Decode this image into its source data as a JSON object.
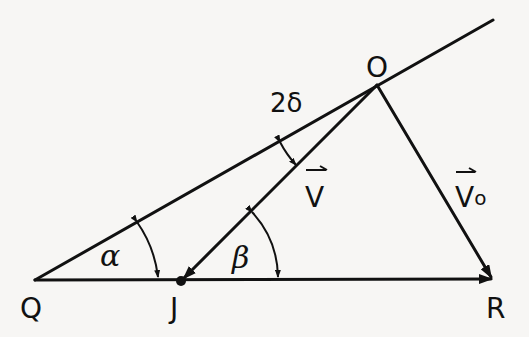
{
  "diagram": {
    "type": "vector-geometry",
    "points": [
      {
        "id": "Q",
        "label": "Q",
        "x": 35,
        "y": 280
      },
      {
        "id": "J",
        "label": "J",
        "x": 181,
        "y": 281
      },
      {
        "id": "R",
        "label": "R",
        "x": 493,
        "y": 279
      },
      {
        "id": "O",
        "label": "O",
        "x": 377,
        "y": 85
      }
    ],
    "vectors": [
      {
        "id": "V",
        "label": "V",
        "from": "O",
        "to": "J"
      },
      {
        "id": "Vo",
        "label": "Vo",
        "from": "O",
        "to": "R"
      },
      {
        "id": "QR",
        "label": "",
        "from": "Q",
        "to": "R"
      }
    ],
    "lines": [
      {
        "id": "QO-extended",
        "from": "Q",
        "through": "O"
      }
    ],
    "angles": [
      {
        "id": "alpha",
        "label": "α",
        "at": "Q",
        "between": [
          "QR",
          "QO"
        ]
      },
      {
        "id": "beta",
        "label": "β",
        "at": "J",
        "between": [
          "JR",
          "JO"
        ]
      },
      {
        "id": "two-delta",
        "label": "2δ",
        "at": "O",
        "between": [
          "OQ",
          "OJ"
        ]
      }
    ]
  },
  "labels": {
    "Q": "Q",
    "J": "J",
    "R": "R",
    "O": "O",
    "V": "V",
    "Vo_main": "V",
    "Vo_sub": "o",
    "alpha": "α",
    "beta": "β",
    "two_delta": "2δ",
    "vector_bar": "⇀"
  }
}
